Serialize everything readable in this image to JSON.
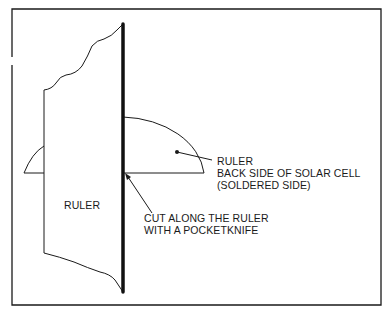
{
  "diagram": {
    "labels": {
      "ruler_main": "RULER",
      "ruler_callout": "RULER",
      "solar_cell_line1": "BACK SIDE OF SOLAR CELL",
      "solar_cell_line2": "(SOLDERED SIDE)",
      "cut_line1": "CUT ALONG THE RULER",
      "cut_line2": "WITH A POCKETKNIFE"
    },
    "colors": {
      "ink": "#1a1a1a",
      "background": "#ffffff"
    }
  }
}
